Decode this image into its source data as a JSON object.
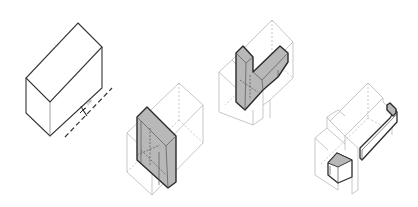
{
  "figure": {
    "type": "isometric massing sequence",
    "background": "#ffffff",
    "colors": {
      "outline": "#333333",
      "ghost_outline": "#b9b9b9",
      "mass_fill": "#b8b8b8"
    },
    "steps": [
      {
        "index": 1,
        "name": "base-volume",
        "description": "Solid rectangular block with dashed street/axis line and entry arrow",
        "annotation": "UM"
      },
      {
        "index": 2,
        "name": "vertical-slab",
        "description": "Ghosted volume with inserted grey vertical slab"
      },
      {
        "index": 3,
        "name": "l-shaped-mass",
        "description": "Ghosted volume with grey vertical core and diagonal arm"
      },
      {
        "index": 4,
        "name": "rail-and-block",
        "description": "Ghosted stepped volume with grey small block and long rail element"
      }
    ]
  }
}
